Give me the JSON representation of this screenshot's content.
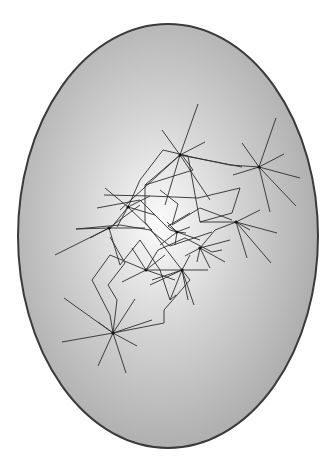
{
  "figure": {
    "top_caption_fragment": "        ",
    "ellipse": {
      "cx": 168,
      "cy": 236,
      "rx": 150,
      "ry": 212,
      "fill_center": "#fbfbfb",
      "fill_mid": "#d2d2d2",
      "fill_edge": "#a6a6a6",
      "stroke": "#3a3a3a",
      "highlight": {
        "cx": 0.47,
        "cy": 0.47,
        "r": 0.6
      }
    },
    "line_color": "#2e2e2e",
    "hubs": [
      {
        "id": "top-center",
        "x": 180,
        "y": 155,
        "spokes": [
          [
            198,
            104
          ],
          [
            162,
            130
          ],
          [
            205,
            142
          ],
          [
            145,
            185
          ],
          [
            120,
            210
          ],
          [
            165,
            205
          ],
          [
            210,
            200
          ],
          [
            242,
            167
          ]
        ]
      },
      {
        "id": "top-right",
        "x": 259,
        "y": 167,
        "spokes": [
          [
            276,
            118
          ],
          [
            242,
            143
          ],
          [
            284,
            154
          ],
          [
            300,
            178
          ],
          [
            296,
            206
          ],
          [
            270,
            212
          ],
          [
            233,
            175
          ]
        ]
      },
      {
        "id": "right-mid",
        "x": 236,
        "y": 222,
        "spokes": [
          [
            260,
            210
          ],
          [
            277,
            233
          ],
          [
            271,
            263
          ],
          [
            247,
            258
          ],
          [
            215,
            230
          ],
          [
            200,
            222
          ],
          [
            250,
            230
          ]
        ]
      },
      {
        "id": "left-mid",
        "x": 128,
        "y": 207,
        "spokes": [
          [
            105,
            188
          ],
          [
            150,
            196
          ],
          [
            117,
            227
          ],
          [
            155,
            215
          ],
          [
            110,
            229
          ],
          [
            152,
            230
          ]
        ]
      },
      {
        "id": "left-far",
        "x": 109,
        "y": 228,
        "spokes": [
          [
            55,
            255
          ],
          [
            76,
            229
          ],
          [
            145,
            228
          ],
          [
            140,
            205
          ],
          [
            120,
            265
          ],
          [
            90,
            238
          ]
        ]
      },
      {
        "id": "center",
        "x": 177,
        "y": 232,
        "spokes": [
          [
            167,
            222
          ],
          [
            186,
            233
          ],
          [
            175,
            245
          ],
          [
            190,
            227
          ],
          [
            160,
            245
          ],
          [
            200,
            240
          ]
        ]
      },
      {
        "id": "center-right",
        "x": 200,
        "y": 248,
        "spokes": [
          [
            215,
            230
          ],
          [
            225,
            262
          ],
          [
            197,
            262
          ],
          [
            210,
            268
          ],
          [
            230,
            240
          ],
          [
            185,
            256
          ]
        ]
      },
      {
        "id": "lower-center",
        "x": 182,
        "y": 270,
        "spokes": [
          [
            208,
            270
          ],
          [
            194,
            305
          ],
          [
            188,
            300
          ],
          [
            170,
            300
          ],
          [
            152,
            280
          ],
          [
            190,
            255
          ],
          [
            150,
            285
          ]
        ]
      },
      {
        "id": "lower-left-center",
        "x": 146,
        "y": 270,
        "spokes": [
          [
            122,
            282
          ],
          [
            165,
            255
          ],
          [
            175,
            280
          ],
          [
            132,
            248
          ]
        ]
      },
      {
        "id": "bottom-left",
        "x": 113,
        "y": 333,
        "spokes": [
          [
            64,
            298
          ],
          [
            62,
            342
          ],
          [
            135,
            299
          ],
          [
            152,
            320
          ],
          [
            137,
            346
          ],
          [
            126,
            373
          ],
          [
            98,
            366
          ],
          [
            98,
            322
          ]
        ]
      }
    ],
    "paths": [
      [
        [
          145,
          185
        ],
        [
          145,
          222
        ],
        [
          182,
          270
        ],
        [
          146,
          270
        ],
        [
          110,
          255
        ],
        [
          92,
          280
        ],
        [
          110,
          315
        ],
        [
          113,
          333
        ],
        [
          164,
          323
        ],
        [
          164,
          310
        ],
        [
          190,
          280
        ],
        [
          182,
          270
        ]
      ],
      [
        [
          145,
          185
        ],
        [
          193,
          170
        ],
        [
          182,
          155
        ],
        [
          230,
          165
        ],
        [
          259,
          167
        ]
      ],
      [
        [
          128,
          207
        ],
        [
          140,
          180
        ],
        [
          163,
          150
        ],
        [
          188,
          156
        ],
        [
          200,
          222
        ]
      ],
      [
        [
          104,
          195
        ],
        [
          150,
          196
        ],
        [
          198,
          198
        ],
        [
          240,
          188
        ],
        [
          232,
          213
        ],
        [
          200,
          222
        ]
      ],
      [
        [
          97,
          208
        ],
        [
          140,
          200
        ],
        [
          170,
          230
        ],
        [
          177,
          232
        ],
        [
          168,
          226
        ],
        [
          190,
          213
        ]
      ],
      [
        [
          76,
          229
        ],
        [
          120,
          225
        ],
        [
          150,
          230
        ],
        [
          170,
          246
        ],
        [
          212,
          232
        ]
      ],
      [
        [
          113,
          333
        ],
        [
          117,
          300
        ],
        [
          108,
          285
        ],
        [
          125,
          263
        ],
        [
          110,
          237
        ]
      ],
      [
        [
          146,
          270
        ],
        [
          158,
          250
        ],
        [
          185,
          238
        ],
        [
          212,
          252
        ],
        [
          222,
          250
        ]
      ],
      [
        [
          160,
          190
        ],
        [
          178,
          204
        ],
        [
          172,
          225
        ],
        [
          200,
          208
        ],
        [
          232,
          220
        ]
      ],
      [
        [
          120,
          265
        ],
        [
          140,
          240
        ],
        [
          160,
          270
        ],
        [
          170,
          300
        ],
        [
          176,
          295
        ]
      ]
    ]
  }
}
